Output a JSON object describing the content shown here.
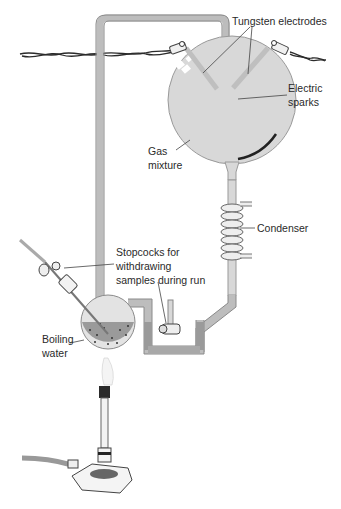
{
  "diagram": {
    "colors": {
      "glass": "#d8d8d8",
      "glass_edge": "#8a8a8a",
      "liquid": "#9a9a9a",
      "wire": "#2b2b2b",
      "flame": "#f4f4f4",
      "text": "#2a2a2a",
      "leader_line": "#444444"
    },
    "labels": {
      "tungsten_electrodes": "Tungsten electrodes",
      "electric_sparks_line1": "Electric",
      "electric_sparks_line2": "sparks",
      "gas_mixture_line1": "Gas",
      "gas_mixture_line2": "mixture",
      "condenser": "Condenser",
      "stopcocks_line1": "Stopcocks for",
      "stopcocks_line2": "withdrawing",
      "stopcocks_line3": "samples during run",
      "boiling_water_line1": "Boiling",
      "boiling_water_line2": "water"
    }
  }
}
